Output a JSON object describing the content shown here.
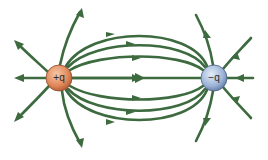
{
  "diagram": {
    "colors": {
      "field_line": "#3d6b3f",
      "positive_charge": "#e0875a",
      "negative_charge": "#8fa8cf",
      "background": "#ffffff"
    },
    "charges": [
      {
        "label": "+q",
        "sign": "positive",
        "cx": 59,
        "cy": 78,
        "r": 13
      },
      {
        "label": "−q",
        "sign": "negative",
        "cx": 214,
        "cy": 78,
        "r": 13
      }
    ]
  }
}
